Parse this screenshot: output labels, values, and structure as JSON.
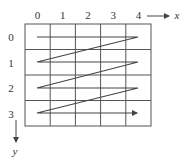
{
  "diagram": {
    "type": "row-major-scan-order",
    "grid": {
      "cols": 5,
      "rows": 4
    },
    "column_labels": [
      "0",
      "1",
      "2",
      "3",
      "4"
    ],
    "row_labels": [
      "0",
      "1",
      "2",
      "3"
    ],
    "x_axis_label": "x",
    "y_axis_label": "y",
    "colors": {
      "grid": "#555555",
      "path": "#444444",
      "text": "#333333"
    },
    "path_description": "Zigzag traversal left-to-right across each row, diagonal return to start of next row, ending with an arrow at row 3"
  }
}
